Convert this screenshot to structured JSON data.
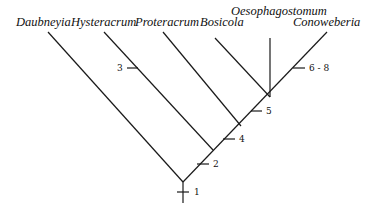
{
  "diagram": {
    "type": "cladogram",
    "taxa": [
      {
        "name": "Daubneyia",
        "label_x": 16,
        "label_y": 26,
        "tip": [
          48,
          32
        ]
      },
      {
        "name": "Hysteracrum",
        "label_x": 71,
        "label_y": 26,
        "tip": [
          104,
          32
        ]
      },
      {
        "name": "Proteracrum",
        "label_x": 135,
        "label_y": 26,
        "tip": [
          163,
          32
        ]
      },
      {
        "name": "Bosicola",
        "label_x": 200,
        "label_y": 26,
        "tip": [
          215,
          38
        ]
      },
      {
        "name": "Oesophagostomum",
        "label_x": 231,
        "label_y": 15,
        "tip": [
          270,
          38
        ]
      },
      {
        "name": "Conoweberia",
        "label_x": 293,
        "label_y": 26,
        "tip": [
          327,
          32
        ]
      }
    ],
    "nodes": {
      "root_base": [
        183,
        203
      ],
      "root": [
        183,
        182
      ],
      "n_hyster": [
        213,
        150
      ],
      "n_proter": [
        241,
        126
      ],
      "n_top": [
        270,
        97
      ]
    },
    "characters": [
      {
        "label": "1",
        "x": 183,
        "y": 192,
        "text_x": 194,
        "text_y": 195
      },
      {
        "label": "2",
        "x": 203,
        "y": 164,
        "text_x": 213,
        "text_y": 167
      },
      {
        "label": "3",
        "x": 132,
        "y": 68,
        "text_x": 117,
        "text_y": 71
      },
      {
        "label": "4",
        "x": 229,
        "y": 139,
        "text_x": 239,
        "text_y": 142
      },
      {
        "label": "5",
        "x": 257,
        "y": 111,
        "text_x": 266,
        "text_y": 114
      },
      {
        "label": "6 - 8",
        "x": 299,
        "y": 68,
        "text_x": 309,
        "text_y": 71
      }
    ]
  }
}
